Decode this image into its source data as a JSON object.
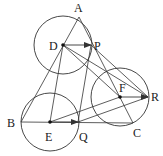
{
  "diagram": {
    "colors": {
      "stroke": "#333333",
      "background": "#ffffff"
    },
    "points": {
      "A": {
        "label": "A",
        "x": 79,
        "y": 17
      },
      "B": {
        "label": "B",
        "x": 21,
        "y": 122
      },
      "C": {
        "label": "C",
        "x": 133,
        "y": 123
      },
      "D": {
        "label": "D",
        "x": 63,
        "y": 45
      },
      "E": {
        "label": "E",
        "x": 50,
        "y": 122
      },
      "F": {
        "label": "F",
        "x": 120,
        "y": 97
      },
      "P": {
        "label": "P",
        "x": 91,
        "y": 45
      },
      "Q": {
        "label": "Q",
        "x": 78,
        "y": 122
      },
      "R": {
        "label": "R",
        "x": 148,
        "y": 97
      }
    },
    "circles": [
      {
        "center": "D",
        "r": 29
      },
      {
        "center": "E",
        "r": 29
      },
      {
        "center": "F",
        "r": 29
      }
    ],
    "segments": [
      [
        "A",
        "B"
      ],
      [
        "B",
        "C"
      ],
      [
        "C",
        "A"
      ],
      [
        "D",
        "E"
      ],
      [
        "D",
        "F"
      ],
      [
        "D",
        "R"
      ],
      [
        "P",
        "Q"
      ],
      [
        "P",
        "R"
      ],
      [
        "E",
        "F"
      ],
      [
        "Q",
        "R"
      ]
    ],
    "vectors": [
      [
        "D",
        "P"
      ],
      [
        "E",
        "Q"
      ],
      [
        "F",
        "R"
      ]
    ]
  }
}
